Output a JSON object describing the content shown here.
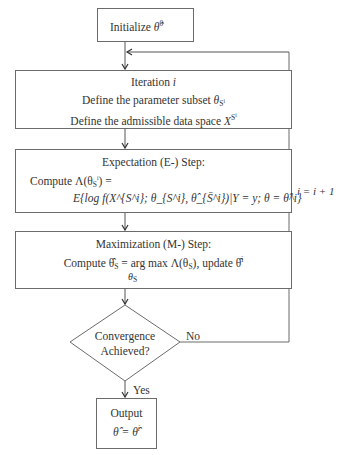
{
  "diagram": {
    "type": "flowchart",
    "nodes": [
      {
        "id": "init",
        "shape": "rectangle",
        "lines": [
          "Initialize θ̂⁰"
        ]
      },
      {
        "id": "iteration",
        "shape": "rectangle",
        "lines": [
          "Iteration i",
          "Define the parameter subset θ_{S^i}",
          "Define the admissible data space X^{S^i}"
        ]
      },
      {
        "id": "e_step",
        "shape": "rectangle",
        "lines": [
          "Expectation (E-) Step:",
          "Compute Λ(θ_{S^i}) =",
          "E{log f(X^{S^i}; θ_{S^i}, θ̂_{S̄^i})|Y = y; θ = θ̂^i}"
        ]
      },
      {
        "id": "m_step",
        "shape": "rectangle",
        "lines": [
          "Maximization (M-) Step:",
          "Compute θ̂_{S^i} = arg max Λ(θ_{S^i}), update θ̂^i",
          "θ_{S^i}"
        ]
      },
      {
        "id": "decision",
        "shape": "diamond",
        "lines": [
          "Convergence",
          "Achieved?"
        ]
      },
      {
        "id": "output",
        "shape": "rectangle",
        "lines": [
          "Output",
          "θ̂ = θ̂^i"
        ]
      }
    ],
    "edges": [
      {
        "from": "init",
        "to": "iteration",
        "label": ""
      },
      {
        "from": "iteration",
        "to": "e_step",
        "label": ""
      },
      {
        "from": "e_step",
        "to": "m_step",
        "label": ""
      },
      {
        "from": "m_step",
        "to": "decision",
        "label": ""
      },
      {
        "from": "decision",
        "to": "output",
        "label": "Yes"
      },
      {
        "from": "decision",
        "to": "iteration",
        "label": "No",
        "loop_label": "i = i + 1"
      }
    ]
  },
  "labels": {
    "init": {
      "text": "Initialize ",
      "sym": "θ̂",
      "sup": "0"
    },
    "iteration": {
      "title": "Iteration ",
      "title_var": "i",
      "line1": "Define the parameter subset ",
      "line1_sym": "θ",
      "line1_sub": "S",
      "line1_subsup": "i",
      "line2": "Define the admissible data space ",
      "line2_sym": "X",
      "line2_sup": "S",
      "line2_supsup": "i"
    },
    "e_step": {
      "title": "Expectation (E-) Step:",
      "line1": "Compute Λ(θ",
      "line1_sub": "S",
      "line1_tail": ") =",
      "line2": "E{log f(X^{S^i}; θ_{S^i}, θ̂_{S̄^i})|Y = y; θ = θ̂^i}"
    },
    "m_step": {
      "title": "Maximization (M-) Step:",
      "line1": "Compute θ̂",
      "line1_sub": "S",
      "line1_tail": " = arg max Λ(θ",
      "line1_tail2": "), update θ̂",
      "line1_sup": "i",
      "line2": "θ",
      "line2_sub": "S"
    },
    "decision": {
      "line1": "Convergence",
      "line2": "Achieved?"
    },
    "yes": "Yes",
    "no": "No",
    "loop": "i = i + 1",
    "output": {
      "title": "Output",
      "eq": "θ̂ = θ̂",
      "eq_sup": "i"
    }
  }
}
